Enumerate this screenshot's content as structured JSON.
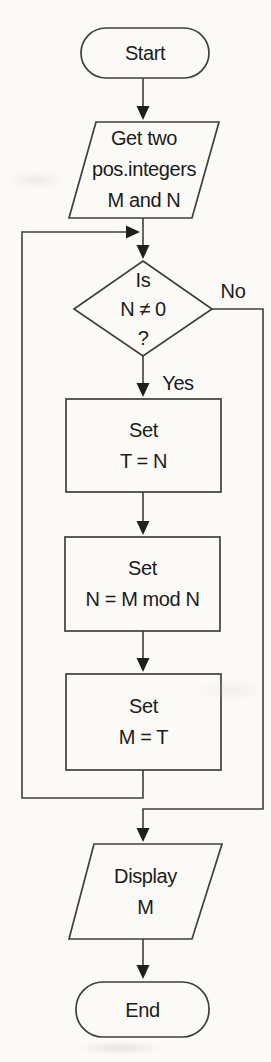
{
  "flowchart": {
    "nodes": {
      "start": {
        "type": "terminator",
        "label": "Start"
      },
      "input": {
        "type": "input-parallelogram",
        "label": "Get two\npos.integers\nM and N"
      },
      "decision": {
        "type": "decision-diamond",
        "label": "Is\nN ≠ 0\n?"
      },
      "set_t": {
        "type": "process",
        "label": "Set\nT = N"
      },
      "set_n": {
        "type": "process",
        "label": "Set\nN = M mod N"
      },
      "set_m": {
        "type": "process",
        "label": "Set\nM = T"
      },
      "display": {
        "type": "output-parallelogram",
        "label": "Display\nM"
      },
      "end": {
        "type": "terminator",
        "label": "End"
      }
    },
    "branch_labels": {
      "yes": "Yes",
      "no": "No"
    },
    "colors": {
      "line": "#3f3f3f",
      "arrowhead": "#1f1f1f",
      "text": "#1b1b1b",
      "background": "#fbfaf7"
    }
  }
}
